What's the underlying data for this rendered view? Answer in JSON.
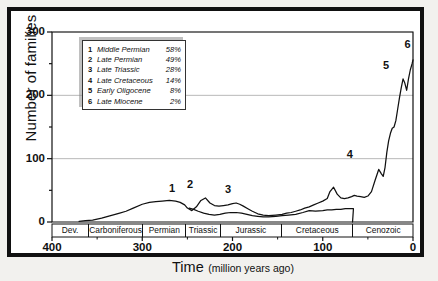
{
  "chart_data": {
    "type": "line",
    "title": "",
    "xlabel_main": "Time",
    "xlabel_sub": "(million years ago)",
    "ylabel": "Number of families",
    "xlim": [
      400,
      0
    ],
    "ylim": [
      0,
      300
    ],
    "x_ticks": [
      400,
      300,
      200,
      100,
      0
    ],
    "y_ticks": [
      0,
      100,
      200,
      300
    ],
    "y_minor_ticks": [
      50,
      150,
      250
    ],
    "grid": "horizontal-at-100-200-300",
    "legend_position": "upper-left-inside",
    "axis_direction": "x reversed (oldest at left)",
    "series": [
      {
        "name": "total-families-upper",
        "x": [
          370,
          363,
          355,
          345,
          335,
          325,
          318,
          310,
          300,
          292,
          285,
          278,
          270,
          263,
          258,
          253,
          250,
          245,
          240,
          235,
          230,
          225,
          220,
          215,
          210,
          205,
          200,
          196,
          192,
          188,
          183,
          178,
          172,
          166,
          160,
          152,
          145,
          140,
          135,
          130,
          125,
          120,
          115,
          110,
          105,
          100,
          95,
          92,
          88,
          84,
          80,
          76,
          72,
          68,
          65,
          62,
          58,
          54,
          50,
          46,
          42,
          38,
          35,
          33,
          31,
          29,
          27,
          25,
          23,
          21,
          19,
          17,
          15,
          13,
          11,
          9,
          7,
          5,
          3,
          1,
          0
        ],
        "y": [
          1,
          2,
          3,
          6,
          10,
          14,
          17,
          22,
          28,
          31,
          32,
          33,
          34,
          33,
          31,
          27,
          22,
          18,
          24,
          34,
          38,
          30,
          26,
          25,
          26,
          27,
          29,
          30,
          28,
          25,
          21,
          17,
          13,
          11,
          10,
          11,
          12,
          14,
          15,
          17,
          19,
          22,
          24,
          27,
          30,
          33,
          37,
          48,
          55,
          44,
          38,
          37,
          38,
          40,
          42,
          41,
          40,
          39,
          41,
          48,
          66,
          83,
          76,
          72,
          86,
          110,
          128,
          140,
          148,
          150,
          160,
          178,
          196,
          212,
          226,
          219,
          208,
          226,
          240,
          250,
          256
        ]
      },
      {
        "name": "lower-curve",
        "x": [
          248,
          243,
          238,
          232,
          226,
          220,
          214,
          208,
          202,
          196,
          190,
          184,
          178,
          172,
          166,
          160,
          152,
          145,
          138,
          130,
          122,
          115,
          108,
          100,
          95,
          90,
          85,
          80,
          75,
          70,
          66,
          66.5,
          67
        ],
        "y": [
          22,
          20,
          17,
          14,
          12,
          11,
          12,
          14,
          15,
          15,
          14,
          12,
          10,
          9,
          8,
          8,
          9,
          10,
          11,
          12,
          15,
          18,
          17,
          18,
          19,
          19,
          20,
          20,
          21,
          21,
          21,
          10,
          0
        ]
      }
    ],
    "event_markers": [
      {
        "id": "1",
        "label": "Middle Permian",
        "pct": "58%",
        "x": 267,
        "y": 38
      },
      {
        "id": "2",
        "label": "Late Permian",
        "pct": "49%",
        "x": 247,
        "y": 45
      },
      {
        "id": "3",
        "label": "Late Triassic",
        "pct": "28%",
        "x": 205,
        "y": 36
      },
      {
        "id": "4",
        "label": "Late Cretaceous",
        "pct": "14%",
        "x": 70,
        "y": 92
      },
      {
        "id": "5",
        "label": "Early Oligocene",
        "pct": "8%",
        "x": 30,
        "y": 232
      },
      {
        "id": "6",
        "label": "Late Miocene",
        "pct": "2%",
        "x": 6,
        "y": 266
      }
    ],
    "periods": [
      {
        "name": "Dev.",
        "start": 400,
        "end": 359
      },
      {
        "name": "Carboniferous",
        "start": 359,
        "end": 299
      },
      {
        "name": "Permian",
        "start": 299,
        "end": 251
      },
      {
        "name": "Triassic",
        "start": 251,
        "end": 213
      },
      {
        "name": "Jurassic",
        "start": 213,
        "end": 145
      },
      {
        "name": "Cretaceous",
        "start": 145,
        "end": 66
      },
      {
        "name": "Cenozoic",
        "start": 66,
        "end": 0
      }
    ]
  },
  "legend": {
    "rows": [
      {
        "num": "1",
        "name": "Middle Permian",
        "pct": "58%"
      },
      {
        "num": "2",
        "name": "Late Permian",
        "pct": "49%"
      },
      {
        "num": "3",
        "name": "Late Triassic",
        "pct": "28%"
      },
      {
        "num": "4",
        "name": "Late Cretaceous",
        "pct": "14%"
      },
      {
        "num": "5",
        "name": "Early Oligocene",
        "pct": "8%"
      },
      {
        "num": "6",
        "name": "Late Miocene",
        "pct": "2%"
      }
    ]
  },
  "colors": {
    "frame": "#111111",
    "line": "#111111",
    "grid": "#9a9a9a",
    "background": "#ffffff",
    "page": "#f2f1ee"
  }
}
